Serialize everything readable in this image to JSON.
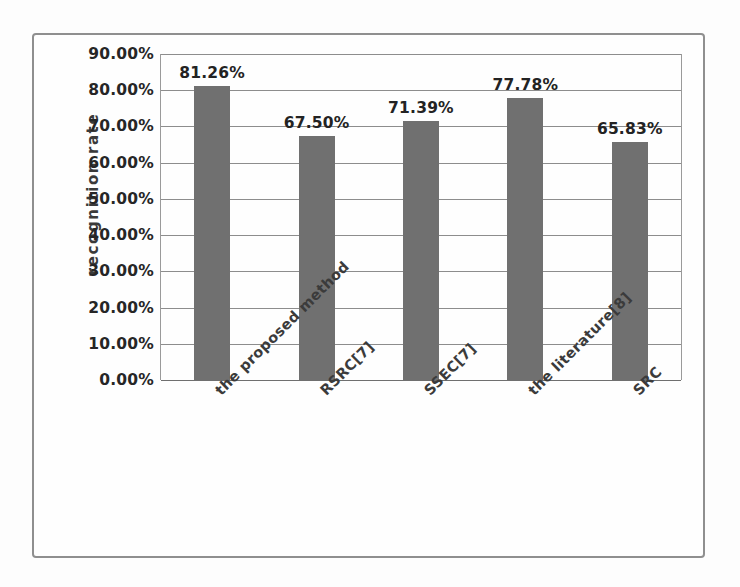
{
  "figure": {
    "frame_border_color": "#8f8f8f",
    "background_color": "#fdfdfd"
  },
  "chart_data": {
    "type": "bar",
    "title": "",
    "subtitle": "",
    "xlabel": "",
    "ylabel": "recognition rate",
    "categories": [
      "the proposed method",
      "RSRC[7]",
      "SSEC[7]",
      "the literature[8]",
      "SRC"
    ],
    "values": [
      81.26,
      67.5,
      71.39,
      77.78,
      65.83
    ],
    "value_labels": [
      "81.26%",
      "67.50%",
      "71.39%",
      "77.78%",
      "65.83%"
    ],
    "ylim": [
      0,
      90
    ],
    "ytick_values": [
      0,
      10,
      20,
      30,
      40,
      50,
      60,
      70,
      80,
      90
    ],
    "ytick_labels": [
      "0.00%",
      "10.00%",
      "20.00%",
      "30.00%",
      "40.00%",
      "50.00%",
      "60.00%",
      "70.00%",
      "80.00%",
      "90.00%"
    ],
    "grid": true,
    "grid_axis": "y",
    "legend": false,
    "legend_position": "none",
    "series_color": "#707070",
    "gridline_color": "#8d8d8d",
    "data_label_color": "#232323",
    "xlabel_rotation_degrees": -45,
    "bar_count": 5
  }
}
